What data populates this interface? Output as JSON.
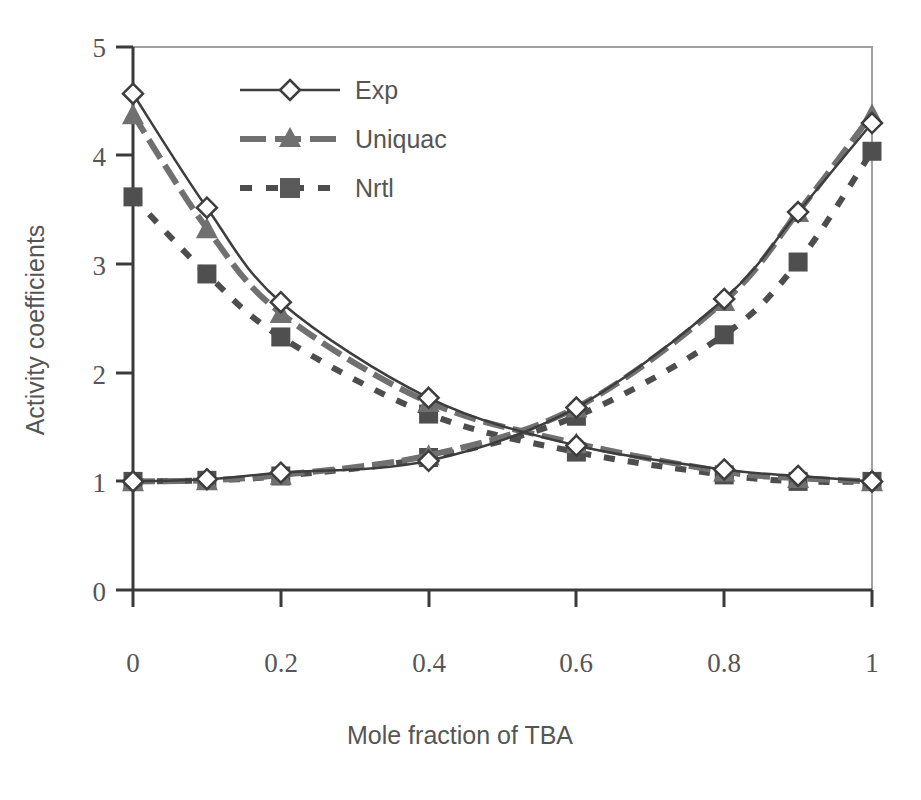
{
  "chart_data": {
    "type": "line",
    "title": "",
    "xlabel": "Mole fraction of TBA",
    "ylabel": "Activity coefficients",
    "xlim": [
      0,
      1
    ],
    "ylim": [
      0,
      5
    ],
    "xticks": [
      0,
      0.2,
      0.4,
      0.6,
      0.8,
      1
    ],
    "xtick_labels": [
      "0",
      "0.2",
      "0.4",
      "0.6",
      "0.8",
      "1"
    ],
    "yticks": [
      0,
      1,
      2,
      3,
      4,
      5
    ],
    "ytick_labels": [
      "0",
      "1",
      "2",
      "3",
      "4",
      "5"
    ],
    "grid": false,
    "legend_position": "upper-left-inside",
    "legend": [
      {
        "label": "Exp",
        "marker": "diamond-open",
        "linestyle": "solid",
        "color": "#404040"
      },
      {
        "label": "Uniquac",
        "marker": "triangle-filled",
        "linestyle": "dashed",
        "color": "#6e6e6e"
      },
      {
        "label": "Nrtl",
        "marker": "square-filled",
        "linestyle": "dotted",
        "color": "#505050"
      }
    ],
    "series": [
      {
        "name": "Exp",
        "component": "gamma-1-descending",
        "marker": "diamond-open",
        "linestyle": "solid",
        "x": [
          0,
          0.1,
          0.2,
          0.4,
          0.6,
          0.8,
          0.9,
          1
        ],
        "y": [
          4.57,
          3.52,
          2.65,
          1.77,
          1.33,
          1.11,
          1.05,
          1.0
        ]
      },
      {
        "name": "Exp",
        "component": "gamma-2-ascending",
        "marker": "diamond-open",
        "linestyle": "solid",
        "x": [
          0,
          0.1,
          0.2,
          0.4,
          0.6,
          0.8,
          0.9,
          1
        ],
        "y": [
          1.0,
          1.02,
          1.08,
          1.19,
          1.68,
          2.68,
          3.48,
          4.3
        ]
      },
      {
        "name": "Uniquac",
        "component": "gamma-1-descending",
        "marker": "triangle-filled",
        "linestyle": "dashed",
        "x": [
          0,
          0.1,
          0.2,
          0.4,
          0.6,
          0.8,
          0.9,
          1
        ],
        "y": [
          4.38,
          3.33,
          2.55,
          1.73,
          1.35,
          1.09,
          1.03,
          1.0
        ]
      },
      {
        "name": "Uniquac",
        "component": "gamma-2-ascending",
        "marker": "triangle-filled",
        "linestyle": "dashed",
        "x": [
          0,
          0.1,
          0.2,
          0.4,
          0.6,
          0.8,
          0.9,
          1
        ],
        "y": [
          1.0,
          1.01,
          1.06,
          1.24,
          1.68,
          2.66,
          3.48,
          4.38
        ]
      },
      {
        "name": "Nrtl",
        "component": "gamma-1-descending",
        "marker": "square-filled",
        "linestyle": "dotted",
        "x": [
          0,
          0.1,
          0.2,
          0.4,
          0.6,
          0.8,
          0.9,
          1
        ],
        "y": [
          3.62,
          2.91,
          2.33,
          1.62,
          1.27,
          1.06,
          1.0,
          1.0
        ]
      },
      {
        "name": "Nrtl",
        "component": "gamma-2-ascending",
        "marker": "square-filled",
        "linestyle": "dotted",
        "x": [
          0,
          0.1,
          0.2,
          0.4,
          0.6,
          0.8,
          0.9,
          1
        ],
        "y": [
          1.0,
          1.01,
          1.05,
          1.22,
          1.6,
          2.35,
          3.02,
          4.04
        ]
      }
    ]
  },
  "axes": {
    "x_title": "Mole fraction of TBA",
    "y_title": "Activity coefficients"
  },
  "ticks": {
    "x": [
      "0",
      "0.2",
      "0.4",
      "0.6",
      "0.8",
      "1"
    ],
    "y": [
      "5",
      "4",
      "3",
      "2",
      "1",
      "0"
    ]
  },
  "legend_labels": {
    "exp": "Exp",
    "uniquac": "Uniquac",
    "nrtl": "Nrtl"
  },
  "colors": {
    "exp": "#3d3d3d",
    "uniquac": "#707070",
    "nrtl": "#4d4d4d",
    "axis": "#3a3a3a",
    "frame": "#9a9a9a",
    "text": "#555555"
  }
}
